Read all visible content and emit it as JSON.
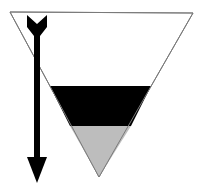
{
  "diagram": {
    "colors": {
      "background": "#ffffff",
      "outline": "#7a7a7a",
      "upper_fill": "#ffffff",
      "middle_band": "#000000",
      "bottom_fill": "#bdbdbd",
      "arrow": "#000000"
    },
    "shapes": {
      "triangle": {
        "points": "10,12 193,13 99,177"
      },
      "black_band": {
        "points": "50,86 151,86 131,126 70,126"
      },
      "gray_bottom": {
        "points": "70,126 131,126 99,177"
      },
      "arrow_shaft": {
        "x": 34,
        "y": 30,
        "width": 6,
        "height": 130
      },
      "arrow_fletching": {
        "points": "27,15 37,24 47,15 47,27 40,36 34,36 27,27"
      },
      "arrow_head": {
        "points": "27,157 47,157 37,183"
      }
    },
    "arrow_direction": "down"
  }
}
